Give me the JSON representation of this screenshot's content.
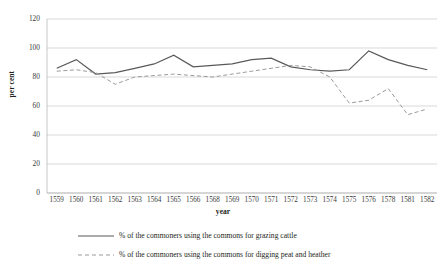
{
  "chart_data": {
    "type": "line",
    "title": "",
    "xlabel": "year",
    "ylabel": "per cent",
    "ylim": [
      0,
      120
    ],
    "ytick_step": 20,
    "yticks": [
      "0",
      "20",
      "40",
      "60",
      "80",
      "100",
      "120"
    ],
    "grid": true,
    "legend_position": "bottom",
    "categories": [
      "1559",
      "1560",
      "1561",
      "1562",
      "1563",
      "1564",
      "1565",
      "1566",
      "1568",
      "1569",
      "1570",
      "1571",
      "1572",
      "1573",
      "1574",
      "1575",
      "1576",
      "1578",
      "1581",
      "1582"
    ],
    "series": [
      {
        "name": "% of the commoners using the commons for grazing cattle",
        "style": "solid",
        "color": "#595959",
        "values": [
          86,
          92,
          82,
          83,
          86,
          89,
          95,
          87,
          88,
          89,
          92,
          93,
          87,
          85,
          84,
          85,
          98,
          92,
          88,
          85
        ]
      },
      {
        "name": "% of the commoners using the commons for digging peat and heather",
        "style": "dashed",
        "color": "#9a9a9a",
        "values": [
          84,
          85,
          83,
          75,
          80,
          81,
          82,
          81,
          80,
          82,
          84,
          86,
          88,
          87,
          80,
          62,
          64,
          72,
          54,
          58
        ]
      }
    ]
  },
  "legend": {
    "items": [
      {
        "label": "% of the commoners using the commons for grazing cattle",
        "key": "solid-line-key"
      },
      {
        "label": "% of the commoners using the commons for digging peat and heather",
        "key": "dashed-line-key"
      }
    ]
  },
  "colors": {
    "series_1": "#595959",
    "series_2": "#9a9a9a",
    "grid": "#c8c8c8",
    "text": "#231f20"
  }
}
